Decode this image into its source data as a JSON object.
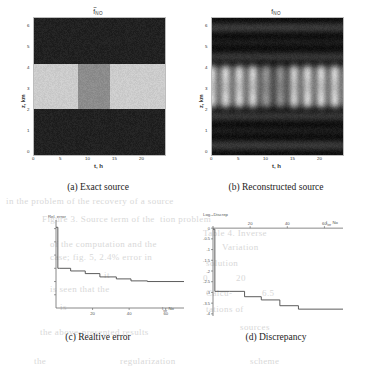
{
  "figure": {
    "panels": [
      {
        "id": "a",
        "caption": "(a) Exact source",
        "title_base": "f",
        "title_sub": "NO",
        "title_tilde": true,
        "xlabel": "t, h",
        "ylabel": "z, km",
        "xticks": [
          "0",
          "5",
          "10",
          "15",
          "20"
        ],
        "yticks": [
          "0",
          "1",
          "2",
          "3",
          "4",
          "5",
          "6"
        ],
        "xlim": [
          0,
          24
        ],
        "ylim": [
          0,
          6
        ]
      },
      {
        "id": "b",
        "caption": "(b) Reconstructed source",
        "title_base": "f",
        "title_sub": "NO",
        "title_tilde": false,
        "xlabel": "t, h",
        "ylabel": "z, km",
        "xticks": [
          "0",
          "5",
          "10",
          "15",
          "20"
        ],
        "yticks": [
          "0",
          "1",
          "2",
          "3",
          "4",
          "5",
          "6"
        ],
        "xlim": [
          0,
          24
        ],
        "ylim": [
          0,
          6
        ]
      },
      {
        "id": "c",
        "caption": "(c) Realtive error",
        "title": "Rel. error",
        "endlabel_base": "I",
        "endlabel_sub": "ter",
        "endlabel_unit": "No",
        "xticks": [
          "20",
          "40",
          "60"
        ],
        "yticks": [
          "1.2",
          "1",
          "0.8",
          "0.6",
          "0.4",
          "0.2"
        ]
      },
      {
        "id": "d",
        "caption": "(d) Discrepancy",
        "title": "Log₁₀Discrep",
        "endlabel_base": "I",
        "endlabel_sub": "ter",
        "endlabel_unit": "No",
        "xticks": [
          "20",
          "40",
          "60"
        ],
        "yticks": [
          "0",
          "-0.5",
          "-1",
          "-1.5",
          "-2",
          "-2.5",
          "-3",
          "-3.5",
          "-4"
        ]
      }
    ]
  },
  "chart_data": [
    {
      "type": "heatmap",
      "panel": "a",
      "title": "f̃_NO",
      "xlabel": "t, h",
      "ylabel": "z, km",
      "xlim": [
        0,
        24
      ],
      "ylim": [
        0,
        6
      ],
      "xticks": [
        0,
        5,
        10,
        15,
        20
      ],
      "yticks": [
        0,
        1,
        2,
        3,
        4,
        5,
        6
      ],
      "colormap": "gray",
      "description": "Piecewise-constant exact source: dark background (low value) everywhere except a bright horizontal band between z=2 and z=4 km; within that band the segment from t=8 to t=14 h is mid-gray (intermediate value) while t=0-8 and t=14-24 are light gray (high value).",
      "regions": [
        {
          "t": [
            0,
            24
          ],
          "z": [
            0,
            2
          ],
          "level": 0.13
        },
        {
          "t": [
            0,
            8
          ],
          "z": [
            2,
            4
          ],
          "level": 0.8
        },
        {
          "t": [
            8,
            14
          ],
          "z": [
            2,
            4
          ],
          "level": 0.55
        },
        {
          "t": [
            14,
            24
          ],
          "z": [
            2,
            4
          ],
          "level": 0.8
        },
        {
          "t": [
            0,
            24
          ],
          "z": [
            4,
            6
          ],
          "level": 0.13
        }
      ]
    },
    {
      "type": "heatmap",
      "panel": "b",
      "title": "f_NO",
      "xlabel": "t, h",
      "ylabel": "z, km",
      "xlim": [
        0,
        24
      ],
      "ylim": [
        0,
        6
      ],
      "xticks": [
        0,
        5,
        10,
        15,
        20
      ],
      "yticks": [
        0,
        1,
        2,
        3,
        4,
        5,
        6
      ],
      "colormap": "gray",
      "description": "Smoothed reconstruction of the exact source: horizontal dark banding oscillations above z=4 and below z=2, with a bright diffuse band between z=2 and z=4 km broken into repeating vertical lobes (period about 2.5 h) separated by darker vertical stripes; the central region near t=9-14 h is dimmer, matching the mid-level block of the exact source.",
      "band_center_z": 3.0,
      "band_halfwidth_z": 1.0,
      "lobe_period_h": 2.5,
      "dim_center_t": [
        9,
        14
      ]
    },
    {
      "type": "line",
      "panel": "c",
      "title": "Rel. error",
      "xlabel": "Iter No",
      "ylabel": "Rel. error",
      "xlim": [
        0,
        70
      ],
      "ylim": [
        0,
        1.3
      ],
      "xticks": [
        20,
        40,
        60
      ],
      "yticks": [
        0.2,
        0.4,
        0.6,
        0.8,
        1.0,
        1.2
      ],
      "step": "post",
      "x": [
        0,
        1,
        2,
        8,
        16,
        24,
        33,
        41,
        50,
        70
      ],
      "y": [
        1.22,
        0.6,
        0.6,
        0.56,
        0.52,
        0.47,
        0.44,
        0.41,
        0.4,
        0.4
      ],
      "description": "Relative error drops sharply from about 1.22 at iteration 0 to about 0.60 after the first iteration, then decreases in small monotone steps to a plateau near 0.40 by iteration 50."
    },
    {
      "type": "line",
      "panel": "d",
      "title": "Log₁₀Discrep",
      "xlabel": "Iter No",
      "ylabel": "Log10 Discrepancy",
      "xlim": [
        0,
        70
      ],
      "ylim": [
        -4.1,
        0.1
      ],
      "xticks": [
        20,
        40,
        60
      ],
      "yticks": [
        0,
        -0.5,
        -1,
        -1.5,
        -2,
        -2.5,
        -3,
        -3.5,
        -4
      ],
      "step": "post",
      "x": [
        0,
        1,
        9,
        17,
        26,
        36,
        46,
        70
      ],
      "y": [
        -0.05,
        -2.95,
        -2.95,
        -3.2,
        -3.35,
        -3.62,
        -3.78,
        -3.78
      ],
      "description": "Log10 discrepancy falls from about -0.05 at iteration 0 to about -2.95 after the first iteration, then decreases in steps to roughly -3.8 and flattens after iteration 46."
    }
  ]
}
